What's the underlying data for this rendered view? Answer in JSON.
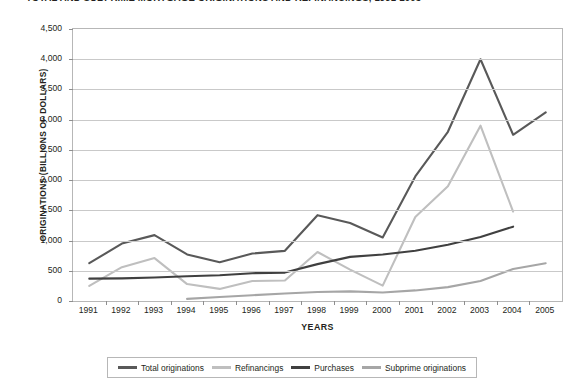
{
  "title": "TOTAL AND SUBPRIME MORTGAGE ORIGINATIONS AND REFINANCINGS, 1991-2005",
  "chart_data": {
    "type": "line",
    "title": "TOTAL AND SUBPRIME MORTGAGE ORIGINATIONS AND REFINANCINGS, 1991-2005",
    "xlabel": "YEARS",
    "ylabel": "ORIGINATIONS (BILLIONS OF DOLLARS)",
    "categories": [
      "1991",
      "1992",
      "1993",
      "1994",
      "1995",
      "1996",
      "1997",
      "1998",
      "1999",
      "2000",
      "2001",
      "2002",
      "2003",
      "2004",
      "2005"
    ],
    "ylim": [
      0,
      4500
    ],
    "yticks": [
      "0",
      "500",
      "1,000",
      "1,500",
      "2,000",
      "2,500",
      "3,000",
      "3,500",
      "4,000",
      "4,500"
    ],
    "ytick_values": [
      0,
      500,
      1000,
      1500,
      2000,
      2500,
      3000,
      3500,
      4000,
      4500
    ],
    "grid": true,
    "legend_position": "bottom",
    "series": [
      {
        "name": "Total originations",
        "color": "#595959",
        "x": [
          "1991",
          "1992",
          "1993",
          "1994",
          "1995",
          "1996",
          "1997",
          "1998",
          "1999",
          "2000",
          "2001",
          "2002",
          "2003",
          "2004",
          "2005"
        ],
        "values": [
          625,
          950,
          1090,
          770,
          640,
          785,
          830,
          1420,
          1290,
          1050,
          2060,
          2800,
          4000,
          2750,
          3120
        ]
      },
      {
        "name": "Refinancings",
        "color": "#bfbfbf",
        "x": [
          "1991",
          "1992",
          "1993",
          "1994",
          "1995",
          "1996",
          "1997",
          "1998",
          "1999",
          "2000",
          "2001",
          "2002",
          "2003",
          "2004"
        ],
        "values": [
          250,
          560,
          710,
          280,
          200,
          330,
          340,
          810,
          520,
          255,
          1390,
          1900,
          2900,
          1480
        ]
      },
      {
        "name": "Purchases",
        "color": "#404040",
        "x": [
          "1991",
          "1992",
          "1993",
          "1994",
          "1995",
          "1996",
          "1997",
          "1998",
          "1999",
          "2000",
          "2001",
          "2002",
          "2003",
          "2004"
        ],
        "values": [
          370,
          375,
          390,
          410,
          425,
          460,
          470,
          610,
          730,
          770,
          830,
          930,
          1060,
          1230
        ]
      },
      {
        "name": "Subprime originations",
        "color": "#a6a6a6",
        "x": [
          "1994",
          "1995",
          "1996",
          "1997",
          "1998",
          "1999",
          "2000",
          "2001",
          "2002",
          "2003",
          "2004",
          "2005"
        ],
        "values": [
          35,
          65,
          95,
          125,
          150,
          160,
          140,
          175,
          230,
          330,
          530,
          625
        ]
      }
    ]
  },
  "legend": {
    "items": [
      {
        "label": "Total originations",
        "color": "#595959"
      },
      {
        "label": "Refinancings",
        "color": "#bfbfbf"
      },
      {
        "label": "Purchases",
        "color": "#404040"
      },
      {
        "label": "Subprime originations",
        "color": "#a6a6a6"
      }
    ]
  }
}
